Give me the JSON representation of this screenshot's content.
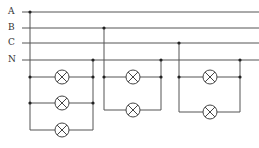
{
  "diagram": {
    "type": "circuit",
    "colors": {
      "wire": "#555555",
      "label": "#333333",
      "background": "#ffffff"
    },
    "bus_lines": [
      {
        "id": "A",
        "label": "A",
        "y": 12
      },
      {
        "id": "B",
        "label": "B",
        "y": 28
      },
      {
        "id": "C",
        "label": "C",
        "y": 43
      },
      {
        "id": "N",
        "label": "N",
        "y": 60
      }
    ],
    "lamp_groups": [
      {
        "phase": "A",
        "left_x": 30,
        "right_x": 93,
        "lamp_x": 62,
        "rows_y": [
          77,
          103,
          130
        ],
        "lamp_count": 3
      },
      {
        "phase": "B",
        "left_x": 104,
        "right_x": 161,
        "lamp_x": 133,
        "rows_y": [
          77,
          110
        ],
        "lamp_count": 2
      },
      {
        "phase": "C",
        "left_x": 179,
        "right_x": 240,
        "lamp_x": 210,
        "rows_y": [
          77,
          112
        ],
        "lamp_count": 2
      }
    ]
  }
}
